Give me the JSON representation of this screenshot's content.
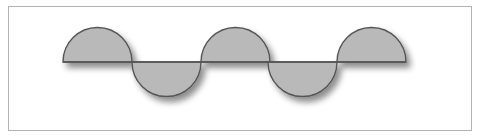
{
  "figure": {
    "frame": {
      "x": 8,
      "y": 6,
      "width": 464,
      "height": 125,
      "stroke": "#b4b4b4"
    },
    "baseline": {
      "y": 62,
      "x_start": 63,
      "x_end": 406
    },
    "radius": 34.5,
    "fill": "#b9b9b9",
    "stroke": "#555555",
    "shadow": "#9a9a9a",
    "semicircles": [
      {
        "cx": 97.5,
        "direction": "up"
      },
      {
        "cx": 166.5,
        "direction": "down"
      },
      {
        "cx": 235.5,
        "direction": "up"
      },
      {
        "cx": 302.5,
        "direction": "down"
      },
      {
        "cx": 371.5,
        "direction": "up"
      }
    ]
  }
}
